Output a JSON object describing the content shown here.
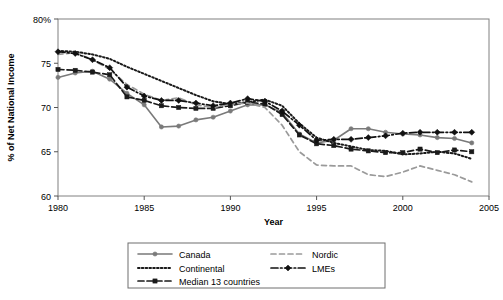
{
  "chart_data": {
    "type": "line",
    "title": "",
    "xlabel": "Year",
    "ylabel": "% of Net National Income",
    "xlim": [
      1980,
      2005
    ],
    "ylim": [
      60,
      80
    ],
    "xticks": [
      1980,
      1985,
      1990,
      1995,
      2000,
      2005
    ],
    "xtick_labels": [
      "1980",
      "1985",
      "1990",
      "1995",
      "2000",
      "2005"
    ],
    "yticks": [
      60,
      65,
      70,
      75,
      80
    ],
    "ytick_labels": [
      "60",
      "65",
      "70",
      "75",
      "80%"
    ],
    "grid": false,
    "legend_position": "below-plot",
    "x": [
      1980,
      1981,
      1982,
      1983,
      1984,
      1985,
      1986,
      1987,
      1988,
      1989,
      1990,
      1991,
      1992,
      1993,
      1994,
      1995,
      1996,
      1997,
      1998,
      1999,
      2000,
      2001,
      2002,
      2003,
      2004
    ],
    "series": [
      {
        "name": "Canada",
        "style": "solid",
        "marker": "circle",
        "color": "#7a7a7a",
        "values": [
          73.4,
          73.9,
          74.1,
          73.2,
          71.6,
          70.3,
          67.8,
          67.9,
          68.6,
          68.9,
          69.6,
          70.3,
          70.3,
          69.4,
          67.0,
          66.0,
          66.3,
          67.6,
          67.6,
          67.2,
          67.0,
          66.9,
          66.6,
          66.5,
          66.0
        ]
      },
      {
        "name": "Continental",
        "style": "dotted",
        "marker": "none",
        "color": "#1a1a1a",
        "values": [
          76.4,
          76.3,
          76.0,
          75.5,
          74.6,
          73.8,
          73.0,
          72.2,
          71.4,
          70.7,
          70.4,
          70.6,
          70.9,
          70.2,
          68.2,
          66.6,
          66.0,
          65.6,
          65.2,
          65.1,
          64.7,
          64.8,
          65.0,
          64.8,
          64.2
        ]
      },
      {
        "name": "Median 13 countries",
        "style": "dashed",
        "marker": "square",
        "color": "#1a1a1a",
        "values": [
          74.3,
          74.2,
          74.0,
          73.7,
          71.2,
          70.8,
          70.2,
          70.0,
          69.9,
          69.9,
          70.2,
          70.6,
          70.4,
          69.2,
          66.9,
          65.9,
          65.7,
          65.3,
          65.1,
          64.9,
          64.9,
          65.3,
          64.9,
          65.2,
          65.0
        ]
      },
      {
        "name": "Nordic",
        "style": "dashed-light",
        "marker": "none",
        "color": "#9a9a9a",
        "values": [
          76.0,
          76.2,
          75.4,
          74.3,
          72.6,
          71.5,
          70.8,
          71.1,
          70.3,
          70.0,
          70.4,
          70.5,
          70.0,
          68.0,
          65.0,
          63.5,
          63.4,
          63.4,
          62.4,
          62.2,
          62.7,
          63.4,
          62.9,
          62.4,
          61.6
        ]
      },
      {
        "name": "LMEs",
        "style": "dashdot",
        "marker": "diamond",
        "color": "#111111",
        "values": [
          76.3,
          76.1,
          75.4,
          74.5,
          72.3,
          71.3,
          70.8,
          70.8,
          70.5,
          70.2,
          70.5,
          71.0,
          70.7,
          69.6,
          68.0,
          66.3,
          66.4,
          66.4,
          66.6,
          66.8,
          67.1,
          67.2,
          67.2,
          67.2,
          67.2
        ]
      }
    ]
  },
  "legend": {
    "items": [
      {
        "label": "Canada",
        "key": "canada"
      },
      {
        "label": "Continental",
        "key": "continental"
      },
      {
        "label": "Median 13 countries",
        "key": "median"
      },
      {
        "label": "Nordic",
        "key": "nordic"
      },
      {
        "label": "LMEs",
        "key": "lmes"
      }
    ]
  }
}
